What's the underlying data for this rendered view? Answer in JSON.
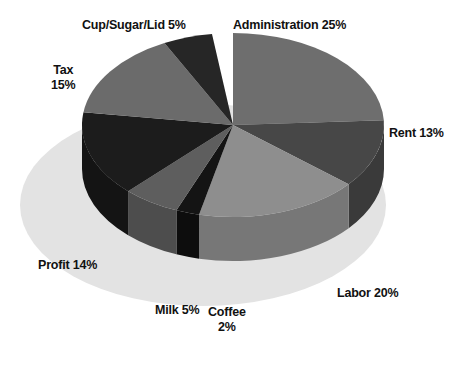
{
  "chart_data": {
    "type": "pie",
    "title": "",
    "subtitle": "",
    "xlabel": "",
    "ylabel": "",
    "legend_position": "none",
    "grid": false,
    "three_d": true,
    "unit": "%",
    "total": 99,
    "categories": [
      "Administration",
      "Rent",
      "Labor",
      "Coffee",
      "Milk",
      "Profit",
      "Tax",
      "Cup/Sugar/Lid"
    ],
    "values": [
      25,
      13,
      20,
      2,
      5,
      14,
      15,
      5
    ],
    "slices": [
      {
        "name": "Administration",
        "value": 25,
        "label": "Administration 25%",
        "color": "#6e6e6e",
        "side_color": "#5a5a5a",
        "start_angle": -90,
        "end_angle": -3
      },
      {
        "name": "Rent",
        "value": 13,
        "label": "Rent 13%",
        "color": "#474747",
        "side_color": "#3a3a3a",
        "start_angle": -3,
        "end_angle": 40
      },
      {
        "name": "Labor",
        "value": 20,
        "label": "Labor 20%",
        "color": "#8e8e8e",
        "side_color": "#777777",
        "start_angle": 40,
        "end_angle": 103
      },
      {
        "name": "Coffee",
        "value": 2,
        "label": "Coffee\n2%",
        "color": "#141414",
        "side_color": "#0d0d0d",
        "start_angle": 103,
        "end_angle": 112
      },
      {
        "name": "Milk",
        "value": 5,
        "label": "Milk 5%",
        "color": "#5e5e5e",
        "side_color": "#4d4d4d",
        "start_angle": 112,
        "end_angle": 134
      },
      {
        "name": "Profit",
        "value": 14,
        "label": "Profit 14%",
        "color": "#1c1c1c",
        "side_color": "#141414",
        "start_angle": 134,
        "end_angle": 188
      },
      {
        "name": "Tax",
        "value": 15,
        "label": "Tax\n15%",
        "color": "#6b6b6b",
        "side_color": "#585858",
        "start_angle": 188,
        "end_angle": 243
      },
      {
        "name": "Cup/Sugar/Lid",
        "value": 5,
        "label": "Cup/Sugar/Lid 5%",
        "color": "#262626",
        "side_color": "#1b1b1b",
        "start_angle": 243,
        "end_angle": 262
      }
    ],
    "labels": {
      "administration": "Administration 25%",
      "rent": "Rent 13%",
      "labor": "Labor 20%",
      "coffee": "Coffee\n2%",
      "milk": "Milk 5%",
      "profit": "Profit 14%",
      "tax": "Tax\n15%",
      "cup_sugar_lid": "Cup/Sugar/Lid 5%"
    },
    "colors": {
      "background": "#ffffff",
      "base_shadow": "#e2e2e2",
      "text": "#111111",
      "administration": "#6e6e6e",
      "rent": "#474747",
      "labor": "#8e8e8e",
      "coffee": "#141414",
      "milk": "#5e5e5e",
      "profit": "#1c1c1c",
      "tax": "#6b6b6b",
      "cup_sugar_lid": "#262626"
    }
  }
}
